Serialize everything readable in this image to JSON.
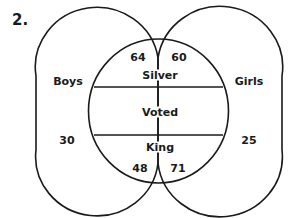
{
  "problem_number": "2.",
  "sets": {
    "boys": {
      "label": "Boys",
      "only_count": "30"
    },
    "girls": {
      "label": "Girls",
      "only_count": "25"
    }
  },
  "central_circle": {
    "top_label": "Silver",
    "middle_label": "Voted",
    "bottom_label": "King",
    "boys_silver": "64",
    "girls_silver": "60",
    "boys_king": "48",
    "girls_king": "71"
  },
  "colors": {
    "stroke": "#1a1a1a",
    "background": "#ffffff"
  }
}
